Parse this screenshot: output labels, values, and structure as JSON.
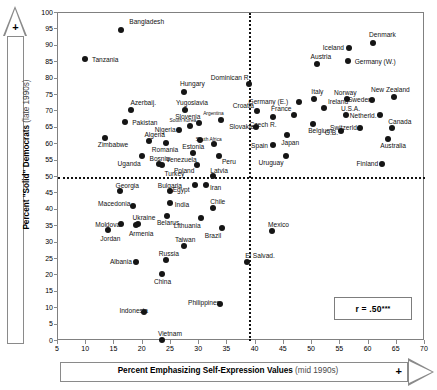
{
  "chart_data": {
    "type": "scatter",
    "title": "",
    "xlabel": "Percent Emphasizing Self-Expression Values",
    "xlabel_sub": "(mid 1990s)",
    "ylabel": "Percent \"Solid\" Democrats",
    "ylabel_sub": "(late 1990s)",
    "xlim": [
      5,
      70
    ],
    "ylim": [
      0,
      100
    ],
    "xticks": [
      5,
      10,
      15,
      20,
      25,
      30,
      35,
      40,
      45,
      50,
      55,
      60,
      65,
      70
    ],
    "yticks": [
      0,
      5,
      10,
      15,
      20,
      25,
      30,
      35,
      40,
      45,
      50,
      55,
      60,
      65,
      70,
      75,
      80,
      85,
      90,
      95,
      100
    ],
    "grid": false,
    "reference_lines": {
      "horizontal_y": 50,
      "vertical_x": 38.8
    },
    "annotation": "r = .50",
    "annotation_stars": "***",
    "axis_direction_marker": "+",
    "points": [
      {
        "label": "Bangladesh",
        "x": 16.2,
        "y": 94.8,
        "lx": 8,
        "ly": -12
      },
      {
        "label": "Tanzania",
        "x": 9.8,
        "y": 86.0,
        "lx": 7,
        "ly": -3
      },
      {
        "label": "Hungary",
        "x": 27.3,
        "y": 75.8,
        "lx": -4,
        "ly": -12
      },
      {
        "label": "Azerbaij.",
        "x": 18.0,
        "y": 70.4,
        "lx": -1,
        "ly": -11
      },
      {
        "label": "Yugoslavia",
        "x": 27.5,
        "y": 70.5,
        "lx": -9,
        "ly": -11
      },
      {
        "label": "Dominican R.",
        "x": 38.8,
        "y": 78.3,
        "lx": -38,
        "ly": -10
      },
      {
        "label": "Iceland",
        "x": 56.5,
        "y": 89.2,
        "lx": -26,
        "ly": -4
      },
      {
        "label": "Denmark",
        "x": 60.8,
        "y": 91.0,
        "lx": -4,
        "ly": -12
      },
      {
        "label": "Austria",
        "x": 50.8,
        "y": 84.5,
        "lx": -6,
        "ly": -11
      },
      {
        "label": "Germany (W.)",
        "x": 56.3,
        "y": 85.4,
        "lx": 7,
        "ly": -3
      },
      {
        "label": "Pakistan",
        "x": 16.9,
        "y": 66.9,
        "lx": 7,
        "ly": -3
      },
      {
        "label": "Nigeria",
        "x": 26.4,
        "y": 64.2,
        "lx": -24,
        "ly": -4
      },
      {
        "label": "South Korea",
        "x": 28.3,
        "y": 65.6,
        "lx": -20,
        "ly": -8,
        "small": true
      },
      {
        "label": "Slovenia",
        "x": 30.0,
        "y": 66.5,
        "lx": -24,
        "ly": -10
      },
      {
        "label": "Argentina",
        "x": 33.9,
        "y": 67.5,
        "lx": -18,
        "ly": -9,
        "small": true
      },
      {
        "label": "Croatia",
        "x": 40.2,
        "y": 70.2,
        "lx": -24,
        "ly": -9
      },
      {
        "label": "Slovakia",
        "x": 40.1,
        "y": 65.2,
        "lx": -27,
        "ly": -4
      },
      {
        "label": "Czech R.",
        "x": 43.0,
        "y": 68.2,
        "lx": -23,
        "ly": 4
      },
      {
        "label": "Germany (E.)",
        "x": 47.6,
        "y": 72.9,
        "lx": -50,
        "ly": -4
      },
      {
        "label": "Italy",
        "x": 50.4,
        "y": 73.8,
        "lx": -3,
        "ly": -11
      },
      {
        "label": "France",
        "x": 46.8,
        "y": 68.8,
        "lx": -23,
        "ly": -10
      },
      {
        "label": "Ireland",
        "x": 52.1,
        "y": 71.0,
        "lx": 4,
        "ly": -10
      },
      {
        "label": "Belgium",
        "x": 50.2,
        "y": 66.3,
        "lx": -5,
        "ly": 3
      },
      {
        "label": "Norway",
        "x": 56.2,
        "y": 73.8,
        "lx": -13,
        "ly": -10
      },
      {
        "label": "Sweden",
        "x": 60.6,
        "y": 73.6,
        "lx": -24,
        "ly": -4
      },
      {
        "label": "New Zealand",
        "x": 64.5,
        "y": 74.5,
        "lx": -23,
        "ly": -11
      },
      {
        "label": "U.S.A.",
        "x": 56.0,
        "y": 68.8,
        "lx": -5,
        "ly": -10
      },
      {
        "label": "Netherld.",
        "x": 62.0,
        "y": 69.0,
        "lx": -30,
        "ly": -3
      },
      {
        "label": "Switzerld.",
        "x": 58.5,
        "y": 64.9,
        "lx": -30,
        "ly": -4
      },
      {
        "label": "Canada",
        "x": 64.2,
        "y": 65.0,
        "lx": -4,
        "ly": -10
      },
      {
        "label": "G.B.",
        "x": 55.1,
        "y": 64.1,
        "lx": -16,
        "ly": -2
      },
      {
        "label": "Australia",
        "x": 63.5,
        "y": 61.5,
        "lx": -8,
        "ly": 3
      },
      {
        "label": "Zimbabwe",
        "x": 13.3,
        "y": 61.8,
        "lx": -7,
        "ly": 3
      },
      {
        "label": "Algeria",
        "x": 21.2,
        "y": 61.0,
        "lx": -5,
        "ly": -10
      },
      {
        "label": "Romania",
        "x": 24.1,
        "y": 60.5,
        "lx": -14,
        "ly": 3
      },
      {
        "label": "Estonia",
        "x": 30.2,
        "y": 61.3,
        "lx": -18,
        "ly": 3
      },
      {
        "label": "South Africa",
        "x": 32.6,
        "y": 60.2,
        "lx": -18,
        "ly": -7,
        "small": true
      },
      {
        "label": "Uganda",
        "x": 19.8,
        "y": 56.5,
        "lx": -24,
        "ly": 4
      },
      {
        "label": "Bosnia",
        "x": 22.8,
        "y": 54.0,
        "lx": -9,
        "ly": -9
      },
      {
        "label": "Venezuela",
        "x": 28.9,
        "y": 57.3,
        "lx": -27,
        "ly": 3
      },
      {
        "label": "Poland",
        "x": 29.6,
        "y": 53.6,
        "lx": -23,
        "ly": 2
      },
      {
        "label": "Peru",
        "x": 33.5,
        "y": 56.5,
        "lx": 3,
        "ly": 2
      },
      {
        "label": "Spain",
        "x": 43.1,
        "y": 59.8,
        "lx": -22,
        "ly": -3
      },
      {
        "label": "Uruguay",
        "x": 45.3,
        "y": 56.3,
        "lx": -27,
        "ly": 3
      },
      {
        "label": "Japan",
        "x": 45.6,
        "y": 62.9,
        "lx": -6,
        "ly": 4
      },
      {
        "label": "Finland",
        "x": 62.3,
        "y": 53.9,
        "lx": -25,
        "ly": -4
      },
      {
        "label": "Turkey",
        "x": 23.5,
        "y": 53.8,
        "lx": 2,
        "ly": 5
      },
      {
        "label": "Latvia",
        "x": 32.5,
        "y": 50.3,
        "lx": -3,
        "ly": -9
      },
      {
        "label": "Georgia",
        "x": 15.9,
        "y": 45.8,
        "lx": -4,
        "ly": -9
      },
      {
        "label": "Bulgaria",
        "x": 24.8,
        "y": 45.6,
        "lx": -12,
        "ly": -9
      },
      {
        "label": "Egypt",
        "x": 29.2,
        "y": 47.6,
        "lx": -22,
        "ly": 1
      },
      {
        "label": "Iran",
        "x": 31.2,
        "y": 47.5,
        "lx": 4,
        "ly": -1
      },
      {
        "label": "Macedonia",
        "x": 18.3,
        "y": 41.2,
        "lx": -35,
        "ly": -6
      },
      {
        "label": "India",
        "x": 24.8,
        "y": 42.0,
        "lx": 5,
        "ly": -2
      },
      {
        "label": "Ukraine",
        "x": 19.1,
        "y": 35.6,
        "lx": -5,
        "ly": -10
      },
      {
        "label": "Belarus",
        "x": 24.3,
        "y": 38.1,
        "lx": -10,
        "ly": 3
      },
      {
        "label": "Moldova",
        "x": 16.2,
        "y": 35.7,
        "lx": -26,
        "ly": -3
      },
      {
        "label": "Armenia",
        "x": 18.8,
        "y": 35.3,
        "lx": -7,
        "ly": 5
      },
      {
        "label": "Lithuania",
        "x": 30.3,
        "y": 37.5,
        "lx": -27,
        "ly": 4
      },
      {
        "label": "Jordan",
        "x": 13.9,
        "y": 33.8,
        "lx": -8,
        "ly": 5
      },
      {
        "label": "Chile",
        "x": 32.5,
        "y": 40.4,
        "lx": -3,
        "ly": -10
      },
      {
        "label": "Taiwan",
        "x": 27.3,
        "y": 28.9,
        "lx": -9,
        "ly": -10
      },
      {
        "label": "Brazil",
        "x": 34.0,
        "y": 34.5,
        "lx": -17,
        "ly": 4
      },
      {
        "label": "Albania",
        "x": 18.8,
        "y": 24.2,
        "lx": -26,
        "ly": -4
      },
      {
        "label": "Russia",
        "x": 24.1,
        "y": 24.6,
        "lx": -7,
        "ly": -10
      },
      {
        "label": "China",
        "x": 23.4,
        "y": 20.4,
        "lx": -8,
        "ly": 4
      },
      {
        "label": "Mexico",
        "x": 42.9,
        "y": 33.6,
        "lx": -4,
        "ly": -10
      },
      {
        "label": "El Salvad.",
        "x": 38.5,
        "y": 24.0,
        "lx": -2,
        "ly": -10
      },
      {
        "label": "Indonesia",
        "x": 20.3,
        "y": 8.7,
        "lx": -25,
        "ly": -5
      },
      {
        "label": "Philippines",
        "x": 33.7,
        "y": 11.2,
        "lx": -32,
        "ly": -5
      },
      {
        "label": "Vietnam",
        "x": 23.4,
        "y": 0.4,
        "lx": -4,
        "ly": -10
      }
    ]
  }
}
